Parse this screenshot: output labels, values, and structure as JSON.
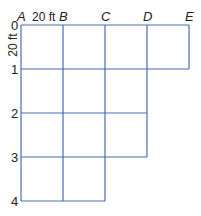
{
  "diagram": {
    "line_color": "#4a6db3",
    "column_labels": [
      "A",
      "B",
      "C",
      "D",
      "E"
    ],
    "row_labels": [
      "0",
      "1",
      "2",
      "3",
      "4"
    ],
    "horizontal_scale": "20 ft",
    "vertical_scale": "20 ft",
    "columns_x": [
      21,
      63,
      105,
      147,
      189
    ],
    "rows_y": [
      25,
      69,
      113,
      157,
      201
    ],
    "rows_extent": [
      {
        "row": "0",
        "from": "A",
        "to": "E"
      },
      {
        "row": "1",
        "from": "A",
        "to": "E"
      },
      {
        "row": "2",
        "from": "A",
        "to": "D"
      },
      {
        "row": "3",
        "from": "A",
        "to": "D"
      },
      {
        "row": "4",
        "from": "A",
        "to": "C"
      }
    ],
    "columns_extent": [
      {
        "col": "A",
        "from": "0",
        "to": "4"
      },
      {
        "col": "B",
        "from": "0",
        "to": "4"
      },
      {
        "col": "C",
        "from": "0",
        "to": "4"
      },
      {
        "col": "D",
        "from": "0",
        "to": "3"
      },
      {
        "col": "E",
        "from": "0",
        "to": "1"
      }
    ]
  }
}
